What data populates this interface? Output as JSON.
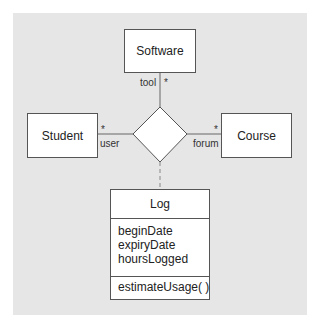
{
  "diagram": {
    "type": "UML class diagram with n-ary association and association class",
    "colors": {
      "background": "#ffffff",
      "panel": "#e6e6e6",
      "box_fill": "#ffffff",
      "stroke": "#555555",
      "text": "#222222"
    },
    "classes": {
      "software": {
        "name": "Software"
      },
      "student": {
        "name": "Student"
      },
      "course": {
        "name": "Course"
      },
      "log": {
        "name": "Log",
        "attributes": [
          "beginDate",
          "expiryDate",
          "hoursLogged"
        ],
        "operations": [
          "estimateUsage( )"
        ]
      }
    },
    "association": {
      "shape": "diamond",
      "ends": {
        "software": {
          "role": "tool",
          "multiplicity": "*"
        },
        "student": {
          "role": "user",
          "multiplicity": "*"
        },
        "course": {
          "role": "forum",
          "multiplicity": "*"
        }
      },
      "association_class_link": "dashed"
    }
  }
}
